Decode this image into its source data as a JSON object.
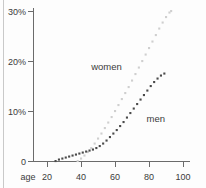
{
  "chart_data": {
    "type": "scatter",
    "title": "",
    "subtitle": "",
    "xlabel": "age",
    "ylabel": "",
    "xlim": [
      13,
      103
    ],
    "ylim": [
      0,
      30
    ],
    "grid": false,
    "legend_position": "inline-annotation",
    "x_tick_labels": [
      "20",
      "40",
      "60",
      "80",
      "100"
    ],
    "x_tick_values": [
      20,
      40,
      60,
      80,
      100
    ],
    "y_tick_labels": [
      "0",
      "10%",
      "20%",
      "30%"
    ],
    "y_tick_values": [
      0,
      10,
      20,
      30
    ],
    "annotations": [
      {
        "text": "women",
        "x": 55,
        "y": 18.2
      },
      {
        "text": "men",
        "x": 84,
        "y": 7.8
      }
    ],
    "series": [
      {
        "name": "women",
        "color": "#cfcfcf",
        "marker": "dot",
        "points": [
          {
            "x": 38,
            "y": 0.0
          },
          {
            "x": 40,
            "y": 0.5
          },
          {
            "x": 42,
            "y": 1.1
          },
          {
            "x": 44,
            "y": 1.8
          },
          {
            "x": 46,
            "y": 2.6
          },
          {
            "x": 48,
            "y": 3.5
          },
          {
            "x": 50,
            "y": 4.5
          },
          {
            "x": 52,
            "y": 5.5
          },
          {
            "x": 54,
            "y": 6.6
          },
          {
            "x": 56,
            "y": 7.7
          },
          {
            "x": 58,
            "y": 8.8
          },
          {
            "x": 60,
            "y": 10.0
          },
          {
            "x": 62,
            "y": 11.2
          },
          {
            "x": 64,
            "y": 12.4
          },
          {
            "x": 66,
            "y": 13.6
          },
          {
            "x": 68,
            "y": 14.8
          },
          {
            "x": 70,
            "y": 16.1
          },
          {
            "x": 72,
            "y": 17.4
          },
          {
            "x": 74,
            "y": 18.7
          },
          {
            "x": 76,
            "y": 20.0
          },
          {
            "x": 78,
            "y": 21.3
          },
          {
            "x": 80,
            "y": 22.6
          },
          {
            "x": 82,
            "y": 23.9
          },
          {
            "x": 84,
            "y": 25.2
          },
          {
            "x": 86,
            "y": 26.5
          },
          {
            "x": 88,
            "y": 27.7
          },
          {
            "x": 90,
            "y": 28.8
          },
          {
            "x": 92,
            "y": 29.7
          },
          {
            "x": 93,
            "y": 30.0
          }
        ]
      },
      {
        "name": "men",
        "color": "#4a4a4a",
        "marker": "dot",
        "points": [
          {
            "x": 25,
            "y": 0.0
          },
          {
            "x": 27,
            "y": 0.3
          },
          {
            "x": 29,
            "y": 0.5
          },
          {
            "x": 31,
            "y": 0.7
          },
          {
            "x": 33,
            "y": 0.9
          },
          {
            "x": 35,
            "y": 1.1
          },
          {
            "x": 37,
            "y": 1.3
          },
          {
            "x": 39,
            "y": 1.5
          },
          {
            "x": 41,
            "y": 1.7
          },
          {
            "x": 43,
            "y": 1.9
          },
          {
            "x": 45,
            "y": 2.1
          },
          {
            "x": 47,
            "y": 2.3
          },
          {
            "x": 49,
            "y": 2.6
          },
          {
            "x": 51,
            "y": 3.0
          },
          {
            "x": 53,
            "y": 3.5
          },
          {
            "x": 55,
            "y": 4.1
          },
          {
            "x": 57,
            "y": 4.8
          },
          {
            "x": 59,
            "y": 5.5
          },
          {
            "x": 61,
            "y": 6.2
          },
          {
            "x": 63,
            "y": 7.0
          },
          {
            "x": 65,
            "y": 7.8
          },
          {
            "x": 67,
            "y": 8.7
          },
          {
            "x": 69,
            "y": 9.6
          },
          {
            "x": 71,
            "y": 10.5
          },
          {
            "x": 73,
            "y": 11.4
          },
          {
            "x": 75,
            "y": 12.3
          },
          {
            "x": 77,
            "y": 13.2
          },
          {
            "x": 79,
            "y": 14.1
          },
          {
            "x": 81,
            "y": 15.0
          },
          {
            "x": 83,
            "y": 15.8
          },
          {
            "x": 85,
            "y": 16.5
          },
          {
            "x": 87,
            "y": 17.1
          },
          {
            "x": 89,
            "y": 17.5
          }
        ]
      }
    ]
  }
}
